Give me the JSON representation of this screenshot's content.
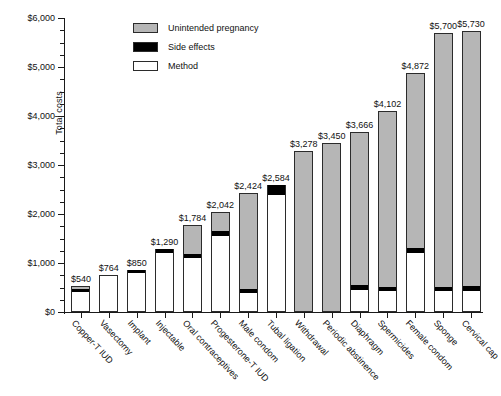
{
  "chart_data": {
    "type": "bar",
    "subtype": "stacked-vertical",
    "title": "",
    "xlabel": "",
    "ylabel": "Total costs",
    "ylim": [
      0,
      6000
    ],
    "ytick_labels": [
      "$0",
      "$1,000",
      "$2,000",
      "$3,000",
      "$4,000",
      "$5,000",
      "$6,000"
    ],
    "ytick_values": [
      0,
      1000,
      2000,
      3000,
      4000,
      5000,
      6000
    ],
    "yminor_step": 250,
    "grid": false,
    "legend_position": "top-center",
    "categories": [
      "Copper-T IUD",
      "Vasectomy",
      "Implant",
      "Injectable",
      "Oral contraceptives",
      "Progesterone-T IUD",
      "Male condom",
      "Tubal ligation",
      "Withdrawal",
      "Periodic abstinence",
      "Diaphragm",
      "Spermicides",
      "Female condom",
      "Sponge",
      "Cervical cap"
    ],
    "totals": [
      540,
      764,
      850,
      1290,
      1784,
      2042,
      2424,
      2584,
      3278,
      3450,
      3666,
      4102,
      4872,
      5700,
      5730
    ],
    "total_labels": [
      "$540",
      "$764",
      "$850",
      "$1,290",
      "$1,784",
      "$2,042",
      "$2,424",
      "$2,584",
      "$3,278",
      "$3,450",
      "$3,666",
      "$4,102",
      "$4,872",
      "$5,700",
      "$5,730"
    ],
    "series": [
      {
        "name": "Method",
        "color": "#ffffff",
        "values": [
          400,
          764,
          790,
          1200,
          1100,
          1550,
          380,
          2390,
          0,
          0,
          450,
          420,
          1200,
          420,
          430
        ]
      },
      {
        "name": "Side effects",
        "color": "#000000",
        "values": [
          60,
          0,
          60,
          90,
          90,
          100,
          90,
          194,
          0,
          0,
          95,
          90,
          110,
          95,
          95
        ]
      },
      {
        "name": "Unintended pregnancy",
        "color": "#b6b6b6",
        "values": [
          80,
          0,
          0,
          0,
          594,
          392,
          1954,
          0,
          3278,
          3450,
          3121,
          3592,
          3562,
          5185,
          5205
        ]
      }
    ]
  },
  "legend": {
    "items": [
      {
        "label": "Unintended pregnancy",
        "swatch": "#b6b6b6"
      },
      {
        "label": "Side effects",
        "swatch": "#000000"
      },
      {
        "label": "Method",
        "swatch": "#ffffff"
      }
    ]
  }
}
